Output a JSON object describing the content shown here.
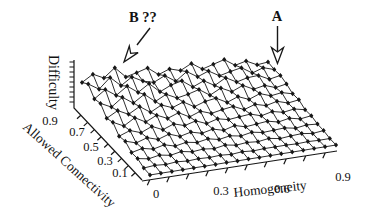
{
  "colors": {
    "background": "#ffffff",
    "ink": "#171717"
  },
  "annotations": {
    "b": {
      "label": "B ??",
      "points_to": "ridge peak near homogeneity 0.15 at high allowed connectivity"
    },
    "a": {
      "label": "A",
      "points_to": "ridge peak near homogeneity 0.65 at high allowed connectivity"
    }
  },
  "chart_data": {
    "type": "surface",
    "subtype": "3d-wireframe-mesh-with-point-markers",
    "title": "",
    "xlabel": "Homogeneity",
    "ylabel": "Allowed Connectivity",
    "zlabel": "Difficulty",
    "x_tick_labels": [
      "0",
      "0.3",
      "0.6",
      "0.9"
    ],
    "y_tick_labels": [
      "0.9",
      "0.7",
      "0.5",
      "0.3",
      "0.1"
    ],
    "x_range": [
      0,
      0.9
    ],
    "y_range": [
      0,
      1
    ],
    "z_range": [
      0,
      1
    ],
    "legend": "none",
    "grid_lines": "wireframe mesh over base plane",
    "surface_description": "flat low-difficulty region at low allowed connectivity (front), noisy spiky high-difficulty ridge at high allowed connectivity (back); ridge height estimated, decreasing slightly with homogeneity",
    "values_estimated": true,
    "grid": {
      "cols": 18,
      "rows": 12,
      "row_order": "back (high allowed connectivity) to front (low)",
      "z": [
        [
          0.45,
          0.58,
          0.47,
          0.64,
          0.42,
          0.47,
          0.53,
          0.36,
          0.44,
          0.37,
          0.48,
          0.33,
          0.39,
          0.45,
          0.3,
          0.35,
          0.24,
          0.26
        ],
        [
          0.55,
          0.41,
          0.61,
          0.41,
          0.55,
          0.43,
          0.37,
          0.47,
          0.32,
          0.48,
          0.34,
          0.42,
          0.29,
          0.34,
          0.38,
          0.24,
          0.31,
          0.24
        ],
        [
          0.38,
          0.53,
          0.38,
          0.53,
          0.37,
          0.51,
          0.31,
          0.41,
          0.46,
          0.3,
          0.39,
          0.26,
          0.38,
          0.26,
          0.31,
          0.32,
          0.21,
          0.25
        ],
        [
          0.42,
          0.31,
          0.47,
          0.32,
          0.46,
          0.28,
          0.39,
          0.28,
          0.32,
          0.38,
          0.23,
          0.34,
          0.23,
          0.32,
          0.21,
          0.25,
          0.17,
          0.21
        ],
        [
          0.25,
          0.37,
          0.26,
          0.38,
          0.23,
          0.34,
          0.25,
          0.33,
          0.2,
          0.27,
          0.3,
          0.18,
          0.26,
          0.17,
          0.25,
          0.17,
          0.2,
          0.14
        ],
        [
          0.3,
          0.19,
          0.32,
          0.2,
          0.3,
          0.2,
          0.28,
          0.16,
          0.24,
          0.16,
          0.2,
          0.23,
          0.13,
          0.2,
          0.14,
          0.19,
          0.12,
          0.15
        ],
        [
          0.15,
          0.23,
          0.15,
          0.24,
          0.14,
          0.22,
          0.15,
          0.21,
          0.12,
          0.18,
          0.13,
          0.15,
          0.17,
          0.1,
          0.15,
          0.1,
          0.13,
          0.08
        ],
        [
          0.18,
          0.11,
          0.18,
          0.11,
          0.18,
          0.1,
          0.15,
          0.09,
          0.14,
          0.08,
          0.14,
          0.08,
          0.1,
          0.12,
          0.07,
          0.11,
          0.06,
          0.09
        ],
        [
          0.08,
          0.13,
          0.08,
          0.13,
          0.07,
          0.11,
          0.07,
          0.11,
          0.06,
          0.1,
          0.06,
          0.1,
          0.06,
          0.07,
          0.08,
          0.04,
          0.07,
          0.05
        ],
        [
          0.09,
          0.05,
          0.09,
          0.05,
          0.09,
          0.05,
          0.07,
          0.04,
          0.08,
          0.04,
          0.06,
          0.04,
          0.07,
          0.03,
          0.05,
          0.06,
          0.03,
          0.05
        ],
        [
          0.03,
          0.05,
          0.03,
          0.05,
          0.03,
          0.04,
          0.03,
          0.04,
          0.02,
          0.04,
          0.02,
          0.03,
          0.03,
          0.03,
          0.02,
          0.03,
          0.02,
          0.02
        ],
        [
          0.02,
          0.02,
          0.02,
          0.02,
          0.02,
          0.02,
          0.02,
          0.02,
          0.02,
          0.02,
          0.02,
          0.02,
          0.02,
          0.02,
          0.02,
          0.02,
          0.02,
          0.02
        ]
      ]
    }
  }
}
